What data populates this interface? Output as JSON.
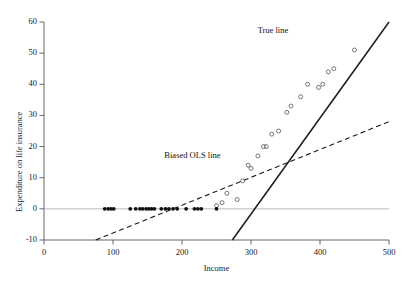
{
  "chart_data": {
    "type": "scatter",
    "title": "",
    "xlabel": "Income",
    "ylabel": "Expenditure on life insurance",
    "xlim": [
      0,
      500
    ],
    "ylim": [
      -10,
      60
    ],
    "xticks": [
      0,
      100,
      200,
      300,
      400,
      500
    ],
    "yticks": [
      -10,
      0,
      10,
      20,
      30,
      40,
      50,
      60
    ],
    "xtick_labels": [
      "0",
      "100",
      "200",
      "300",
      "400",
      "500"
    ],
    "ytick_labels": [
      "-10",
      "0",
      "10",
      "20",
      "30",
      "40",
      "50",
      "60"
    ],
    "grid": false,
    "legend_position": "inline-annotations",
    "series": [
      {
        "name": "censored observations (zero expenditure)",
        "marker": "filled-circle",
        "color": "#111111",
        "points": [
          [
            88,
            0
          ],
          [
            93,
            0
          ],
          [
            97,
            0
          ],
          [
            101,
            0
          ],
          [
            125,
            0
          ],
          [
            133,
            0
          ],
          [
            139,
            0
          ],
          [
            143,
            0
          ],
          [
            148,
            0
          ],
          [
            152,
            0
          ],
          [
            156,
            0
          ],
          [
            160,
            0
          ],
          [
            170,
            0
          ],
          [
            176,
            0
          ],
          [
            181,
            0
          ],
          [
            187,
            0
          ],
          [
            193,
            0
          ],
          [
            206,
            0
          ],
          [
            218,
            0
          ],
          [
            223,
            0
          ],
          [
            228,
            0
          ],
          [
            250,
            0
          ]
        ]
      },
      {
        "name": "uncensored observations (positive expenditure)",
        "marker": "open-circle",
        "color": "#555555",
        "points": [
          [
            250,
            1
          ],
          [
            258,
            2
          ],
          [
            265,
            5
          ],
          [
            280,
            3
          ],
          [
            288,
            9
          ],
          [
            296,
            14
          ],
          [
            300,
            13
          ],
          [
            310,
            17
          ],
          [
            318,
            20
          ],
          [
            322,
            20
          ],
          [
            330,
            24
          ],
          [
            340,
            25
          ],
          [
            352,
            31
          ],
          [
            358,
            33
          ],
          [
            372,
            36
          ],
          [
            382,
            40
          ],
          [
            398,
            39
          ],
          [
            404,
            40
          ],
          [
            412,
            44
          ],
          [
            420,
            45
          ],
          [
            450,
            51
          ]
        ]
      }
    ],
    "lines": [
      {
        "name": "True line",
        "style": "solid",
        "color": "#1a1a1a",
        "label": "True line",
        "x1": 273,
        "y1": -10,
        "x2": 500,
        "y2": 60,
        "slope": 0.308,
        "intercept": -94.2
      },
      {
        "name": "Biased OLS line",
        "style": "dashed",
        "color": "#1a1a1a",
        "label": "Biased OLS line",
        "x1": 75,
        "y1": -10,
        "x2": 500,
        "y2": 28,
        "slope": 0.0894,
        "intercept": -16.7
      }
    ],
    "annotations": [
      {
        "text": "True line",
        "x": 385,
        "y": 57
      },
      {
        "text": "Biased OLS line",
        "x": 215,
        "y": 17
      }
    ],
    "zero_reference_line": true
  }
}
